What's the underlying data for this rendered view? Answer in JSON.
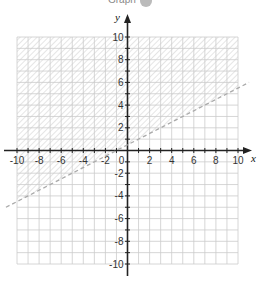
{
  "header": {
    "title": "Graph"
  },
  "chart_data": {
    "type": "line",
    "title": "Graph",
    "xlabel": "x",
    "ylabel": "y",
    "xlim": [
      -10,
      10
    ],
    "ylim": [
      -10,
      10
    ],
    "grid": true,
    "x_ticks": [
      -10,
      -8,
      -6,
      -4,
      -2,
      0,
      2,
      4,
      6,
      8,
      10
    ],
    "y_ticks": [
      -10,
      -8,
      -6,
      -4,
      -2,
      2,
      4,
      6,
      8,
      10
    ],
    "series": [
      {
        "name": "boundary line",
        "style": "dashed",
        "equation": "y = 0.5x + 0.5",
        "x": [
          -11,
          11
        ],
        "y": [
          -5,
          6
        ]
      }
    ],
    "shaded_region": {
      "description": "region above the dashed line (y > 0.5x + 0.5), hatched",
      "boundary": "dashed (strict inequality)"
    }
  },
  "colors": {
    "grid": "#cccccc",
    "axis": "#222222",
    "hatch": "#d0d0d0",
    "boundary": "#aaaaaa"
  }
}
